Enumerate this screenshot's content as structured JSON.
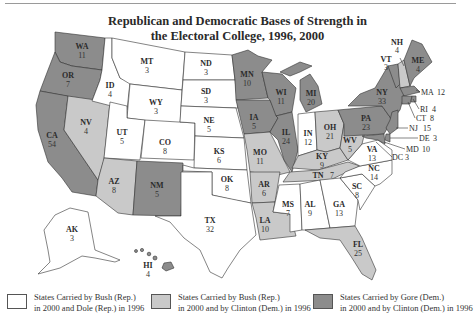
{
  "title_line1": "Republican and Democratic Bases of Strength in",
  "title_line2": "the Electoral College, 1996, 2000",
  "colors": {
    "bush_dole": "#ffffff",
    "bush_clinton": "#c9c9c9",
    "gore_clinton": "#8c8c8c",
    "border": "#333333"
  },
  "legend": [
    {
      "key": "bush_dole",
      "line1": "States Carried by Bush (Rep.)",
      "line2": "in 2000 and Dole (Rep.) in 1996"
    },
    {
      "key": "bush_clinton",
      "line1": "States Carried by Bush (Rep.)",
      "line2": "in 2000 and by Clinton (Dem.) in 1996"
    },
    {
      "key": "gore_clinton",
      "line1": "States Carried by Gore (Dem.)",
      "line2": "in 2000 and by Clinton (Dem.) in 1996"
    }
  ],
  "states": {
    "WA": {
      "ev": "11",
      "cat": "gore_clinton"
    },
    "OR": {
      "ev": "7",
      "cat": "gore_clinton"
    },
    "CA": {
      "ev": "54",
      "cat": "gore_clinton"
    },
    "NV": {
      "ev": "4",
      "cat": "bush_clinton"
    },
    "ID": {
      "ev": "4",
      "cat": "bush_dole"
    },
    "MT": {
      "ev": "3",
      "cat": "bush_dole"
    },
    "WY": {
      "ev": "3",
      "cat": "bush_dole"
    },
    "UT": {
      "ev": "5",
      "cat": "bush_dole"
    },
    "AZ": {
      "ev": "8",
      "cat": "bush_clinton"
    },
    "CO": {
      "ev": "8",
      "cat": "bush_dole"
    },
    "NM": {
      "ev": "5",
      "cat": "gore_clinton"
    },
    "ND": {
      "ev": "3",
      "cat": "bush_dole"
    },
    "SD": {
      "ev": "3",
      "cat": "bush_dole"
    },
    "NE": {
      "ev": "5",
      "cat": "bush_dole"
    },
    "KS": {
      "ev": "6",
      "cat": "bush_dole"
    },
    "OK": {
      "ev": "8",
      "cat": "bush_dole"
    },
    "TX": {
      "ev": "32",
      "cat": "bush_dole"
    },
    "MN": {
      "ev": "10",
      "cat": "gore_clinton"
    },
    "IA": {
      "ev": "5",
      "cat": "gore_clinton"
    },
    "MO": {
      "ev": "11",
      "cat": "bush_clinton"
    },
    "AR": {
      "ev": "6",
      "cat": "bush_clinton"
    },
    "LA": {
      "ev": "10",
      "cat": "bush_clinton"
    },
    "WI": {
      "ev": "11",
      "cat": "gore_clinton"
    },
    "IL": {
      "ev": "24",
      "cat": "gore_clinton"
    },
    "MI": {
      "ev": "20",
      "cat": "gore_clinton"
    },
    "IN": {
      "ev": "12",
      "cat": "bush_dole"
    },
    "OH": {
      "ev": "21",
      "cat": "bush_clinton"
    },
    "KY": {
      "ev": "9",
      "cat": "bush_clinton"
    },
    "TN": {
      "ev": "7",
      "cat": "bush_clinton"
    },
    "MS": {
      "ev": "7",
      "cat": "bush_dole"
    },
    "AL": {
      "ev": "9",
      "cat": "bush_dole"
    },
    "GA": {
      "ev": "13",
      "cat": "bush_dole"
    },
    "FL": {
      "ev": "25",
      "cat": "bush_clinton"
    },
    "SC": {
      "ev": "8",
      "cat": "bush_dole"
    },
    "NC": {
      "ev": "14",
      "cat": "bush_dole"
    },
    "VA": {
      "ev": "13",
      "cat": "bush_dole"
    },
    "WV": {
      "ev": "5",
      "cat": "bush_clinton"
    },
    "PA": {
      "ev": "23",
      "cat": "gore_clinton"
    },
    "NY": {
      "ev": "33",
      "cat": "gore_clinton"
    },
    "VT": {
      "ev": "3",
      "cat": "gore_clinton"
    },
    "NH": {
      "ev": "4",
      "cat": "bush_clinton"
    },
    "ME": {
      "ev": "4",
      "cat": "gore_clinton"
    },
    "MA": {
      "ev": "12",
      "cat": "gore_clinton"
    },
    "RI": {
      "ev": "4",
      "cat": "gore_clinton"
    },
    "CT": {
      "ev": "8",
      "cat": "gore_clinton"
    },
    "NJ": {
      "ev": "15",
      "cat": "gore_clinton"
    },
    "DE": {
      "ev": "3",
      "cat": "gore_clinton"
    },
    "MD": {
      "ev": "10",
      "cat": "gore_clinton"
    },
    "DC": {
      "ev": "3",
      "cat": "gore_clinton"
    },
    "AK": {
      "ev": "3",
      "cat": "bush_dole"
    },
    "HI": {
      "ev": "4",
      "cat": "gore_clinton"
    }
  },
  "labels": {
    "WA": "WA",
    "OR": "OR",
    "CA": "CA",
    "NV": "NV",
    "ID": "ID",
    "MT": "MT",
    "WY": "WY",
    "UT": "UT",
    "AZ": "AZ",
    "CO": "CO",
    "NM": "NM",
    "ND": "ND",
    "SD": "SD",
    "NE": "NE",
    "KS": "KS",
    "OK": "OK",
    "TX": "TX",
    "MN": "MN",
    "IA": "IA",
    "MO": "MO",
    "AR": "AR",
    "LA": "LA",
    "WI": "WI",
    "IL": "IL",
    "MI": "MI",
    "IN": "IN",
    "OH": "OH",
    "KY": "KY",
    "TN": "TN",
    "MS": "MS",
    "AL": "AL",
    "GA": "GA",
    "FL": "FL",
    "SC": "SC",
    "NC": "NC",
    "VA": "VA",
    "WV": "WV",
    "PA": "PA",
    "NY": "NY",
    "VT": "VT",
    "NH": "NH",
    "ME": "ME",
    "MA": "MA",
    "RI": "RI",
    "CT": "CT",
    "NJ": "NJ",
    "DE": "DE",
    "MD": "MD",
    "DC": "DC",
    "AK": "AK",
    "HI": "HI"
  }
}
